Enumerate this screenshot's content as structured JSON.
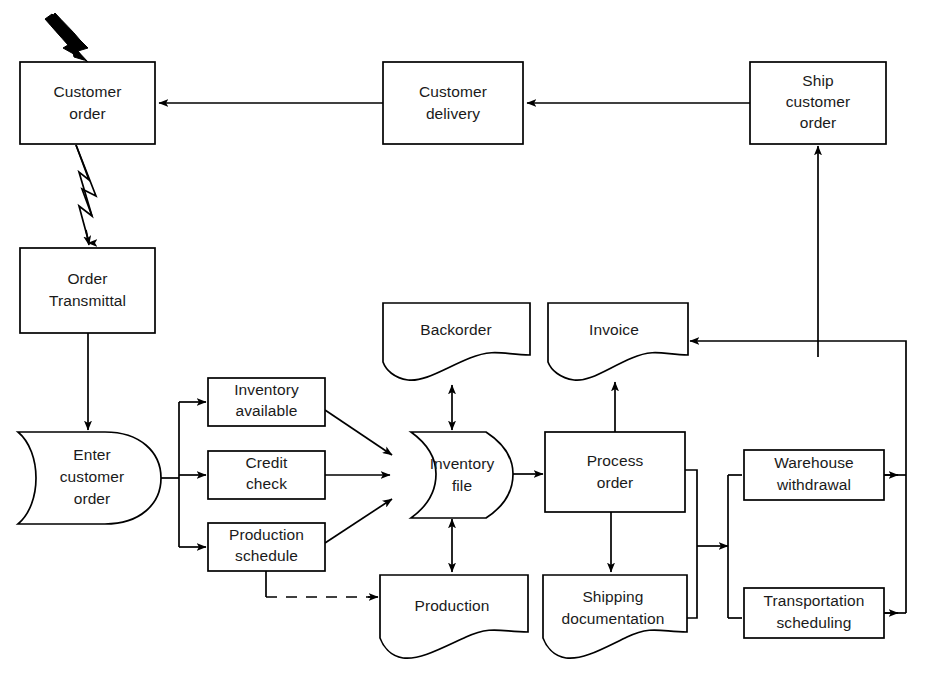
{
  "diagram": {
    "title_visible_fragment": "",
    "type": "flowchart",
    "background_color": "#ffffff",
    "line_color": "#000000",
    "text_color": "#1a1a1a",
    "nodes": [
      {
        "id": "customer-order",
        "label_line1": "Customer",
        "label_line2": "order",
        "label_line3": "",
        "shape": "rectangle",
        "x": 20,
        "y": 62,
        "w": 135,
        "h": 82
      },
      {
        "id": "customer-delivery",
        "label_line1": "Customer",
        "label_line2": "delivery",
        "label_line3": "",
        "shape": "rectangle",
        "x": 383,
        "y": 62,
        "w": 140,
        "h": 82
      },
      {
        "id": "ship-customer-order",
        "label_line1": "Ship",
        "label_line2": "customer",
        "label_line3": "order",
        "shape": "rectangle",
        "x": 750,
        "y": 62,
        "w": 136,
        "h": 82
      },
      {
        "id": "order-transmittal",
        "label_line1": "Order",
        "label_line2": "Transmittal",
        "label_line3": "",
        "shape": "rectangle",
        "x": 20,
        "y": 248,
        "w": 135,
        "h": 85
      },
      {
        "id": "enter-customer-order",
        "label_line1": "Enter",
        "label_line2": "customer",
        "label_line3": "order",
        "shape": "manual-input",
        "x": 18,
        "y": 432,
        "w": 143,
        "h": 92
      },
      {
        "id": "inventory-available",
        "label_line1": "Inventory",
        "label_line2": "available",
        "label_line3": "",
        "shape": "rectangle",
        "x": 208,
        "y": 378,
        "w": 117,
        "h": 48
      },
      {
        "id": "credit-check",
        "label_line1": "Credit",
        "label_line2": "check",
        "label_line3": "",
        "shape": "rectangle",
        "x": 208,
        "y": 451,
        "w": 117,
        "h": 48
      },
      {
        "id": "production-schedule",
        "label_line1": "Production",
        "label_line2": "schedule",
        "label_line3": "",
        "shape": "rectangle",
        "x": 208,
        "y": 523,
        "w": 117,
        "h": 48
      },
      {
        "id": "backorder",
        "label_line1": "Backorder",
        "label_line2": "",
        "label_line3": "",
        "shape": "document",
        "x": 383,
        "y": 303,
        "w": 147,
        "h": 75
      },
      {
        "id": "invoice",
        "label_line1": "Invoice",
        "label_line2": "",
        "label_line3": "",
        "shape": "document",
        "x": 548,
        "y": 303,
        "w": 140,
        "h": 75
      },
      {
        "id": "inventory-file",
        "label_line1": "Inventory",
        "label_line2": "file",
        "label_line3": "",
        "shape": "cylinder",
        "x": 388,
        "y": 432,
        "w": 125,
        "h": 85
      },
      {
        "id": "process-order",
        "label_line1": "Process",
        "label_line2": "order",
        "label_line3": "",
        "shape": "rectangle",
        "x": 545,
        "y": 432,
        "w": 140,
        "h": 80
      },
      {
        "id": "warehouse-withdrawal",
        "label_line1": "Warehouse",
        "label_line2": "withdrawal",
        "label_line3": "",
        "shape": "rectangle",
        "x": 744,
        "y": 450,
        "w": 140,
        "h": 50
      },
      {
        "id": "production",
        "label_line1": "Production",
        "label_line2": "",
        "label_line3": "",
        "shape": "document",
        "x": 380,
        "y": 575,
        "w": 148,
        "h": 80
      },
      {
        "id": "shipping-documentation",
        "label_line1": "Shipping",
        "label_line2": "documentation",
        "label_line3": "",
        "shape": "document",
        "x": 543,
        "y": 575,
        "w": 144,
        "h": 80
      },
      {
        "id": "transportation-scheduling",
        "label_line1": "Transportation",
        "label_line2": "scheduling",
        "label_line3": "",
        "shape": "rectangle",
        "x": 744,
        "y": 588,
        "w": 140,
        "h": 50
      }
    ],
    "connectors": [
      {
        "id": "external-input-to-customer-order",
        "from": "external",
        "to": "customer-order",
        "style": "bold-curved-arrow"
      },
      {
        "id": "customer-delivery-to-customer-order",
        "from": "customer-delivery",
        "to": "customer-order",
        "style": "solid"
      },
      {
        "id": "ship-customer-order-to-customer-delivery",
        "from": "ship-customer-order",
        "to": "customer-delivery",
        "style": "solid"
      },
      {
        "id": "customer-order-to-order-transmittal",
        "from": "customer-order",
        "to": "order-transmittal",
        "style": "lightning"
      },
      {
        "id": "order-transmittal-to-enter-customer-order",
        "from": "order-transmittal",
        "to": "enter-customer-order",
        "style": "solid"
      },
      {
        "id": "enter-to-inventory-available",
        "from": "enter-customer-order",
        "to": "inventory-available",
        "style": "solid"
      },
      {
        "id": "enter-to-credit-check",
        "from": "enter-customer-order",
        "to": "credit-check",
        "style": "solid"
      },
      {
        "id": "enter-to-production-schedule",
        "from": "enter-customer-order",
        "to": "production-schedule",
        "style": "solid"
      },
      {
        "id": "inventory-available-to-inventory-file",
        "from": "inventory-available",
        "to": "inventory-file",
        "style": "solid"
      },
      {
        "id": "credit-check-to-inventory-file",
        "from": "credit-check",
        "to": "inventory-file",
        "style": "solid"
      },
      {
        "id": "production-schedule-to-inventory-file",
        "from": "production-schedule",
        "to": "inventory-file",
        "style": "solid"
      },
      {
        "id": "production-schedule-to-production",
        "from": "production-schedule",
        "to": "production",
        "style": "dashed"
      },
      {
        "id": "inventory-file-to-backorder",
        "from": "inventory-file",
        "to": "backorder",
        "style": "double-arrow"
      },
      {
        "id": "inventory-file-to-production",
        "from": "inventory-file",
        "to": "production",
        "style": "double-arrow"
      },
      {
        "id": "inventory-file-to-process-order",
        "from": "inventory-file",
        "to": "process-order",
        "style": "solid"
      },
      {
        "id": "process-order-to-invoice",
        "from": "process-order",
        "to": "invoice",
        "style": "solid"
      },
      {
        "id": "process-order-to-shipping-documentation",
        "from": "process-order",
        "to": "shipping-documentation",
        "style": "solid"
      },
      {
        "id": "process-order-to-warehouse-withdrawal",
        "from": "process-order",
        "to": "warehouse-withdrawal",
        "style": "solid"
      },
      {
        "id": "process-order-to-transportation-scheduling",
        "from": "process-order",
        "to": "transportation-scheduling",
        "style": "solid"
      },
      {
        "id": "warehouse-withdrawal-to-invoice-bus",
        "from": "warehouse-withdrawal",
        "to": "invoice",
        "style": "solid"
      },
      {
        "id": "transportation-scheduling-to-invoice-bus",
        "from": "transportation-scheduling",
        "to": "invoice",
        "style": "solid"
      },
      {
        "id": "bus-to-ship-customer-order",
        "from": "invoice-bus",
        "to": "ship-customer-order",
        "style": "solid"
      }
    ]
  }
}
